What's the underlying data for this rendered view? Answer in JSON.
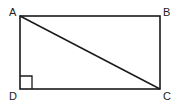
{
  "diagram": {
    "type": "geometry",
    "shape": "rectangle",
    "vertices": [
      {
        "label": "A",
        "x": 20,
        "y": 16
      },
      {
        "label": "B",
        "x": 160,
        "y": 16
      },
      {
        "label": "C",
        "x": 160,
        "y": 89
      },
      {
        "label": "D",
        "x": 20,
        "y": 89
      }
    ],
    "diagonal": [
      "A",
      "C"
    ],
    "right_angle_marker": "D",
    "colors": {
      "stroke": "#1a1a1a",
      "background": "#ffffff"
    }
  }
}
